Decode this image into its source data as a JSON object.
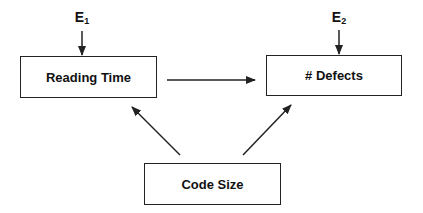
{
  "diagram": {
    "nodes": [
      {
        "id": "reading_time",
        "label": "Reading Time",
        "x": 20,
        "y": 56,
        "w": 137,
        "h": 42
      },
      {
        "id": "defects",
        "label": "# Defects",
        "x": 266,
        "y": 55,
        "w": 136,
        "h": 41
      },
      {
        "id": "code_size",
        "label": "Code Size",
        "x": 144,
        "y": 163,
        "w": 137,
        "h": 42
      }
    ],
    "error_terms": [
      {
        "id": "e1",
        "base": "E",
        "sub": "1",
        "target": "reading_time",
        "x": 82,
        "y": 10
      },
      {
        "id": "e2",
        "base": "E",
        "sub": "2",
        "target": "defects",
        "x": 339,
        "y": 10
      }
    ],
    "edges": [
      {
        "from": "reading_time",
        "to": "defects",
        "x1": 167,
        "y1": 80,
        "x2": 255,
        "y2": 80
      },
      {
        "from": "code_size",
        "to": "reading_time",
        "x1": 180,
        "y1": 155,
        "x2": 132,
        "y2": 107
      },
      {
        "from": "code_size",
        "to": "defects",
        "x1": 243,
        "y1": 155,
        "x2": 291,
        "y2": 105
      },
      {
        "from": "e1",
        "to": "reading_time",
        "x1": 82,
        "y1": 31,
        "x2": 82,
        "y2": 55
      },
      {
        "from": "e2",
        "to": "defects",
        "x1": 339,
        "y1": 30,
        "x2": 339,
        "y2": 54
      }
    ],
    "colors": {
      "stroke": "#222222",
      "text": "#111111",
      "background": "#ffffff"
    }
  }
}
